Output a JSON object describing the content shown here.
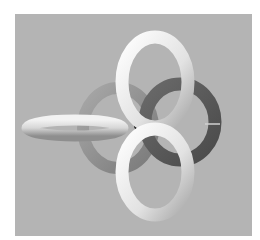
{
  "image": {
    "subject": "3D render of interlinked tori forming a link",
    "background_color": "#b4b4b4",
    "rings": [
      {
        "name": "left-horizontal-ring",
        "shade": "light"
      },
      {
        "name": "medium-gray-ring",
        "shade": "medium"
      },
      {
        "name": "dark-gray-ring",
        "shade": "dark"
      },
      {
        "name": "top-white-ring",
        "shade": "white"
      },
      {
        "name": "bottom-white-ring",
        "shade": "white"
      }
    ]
  }
}
